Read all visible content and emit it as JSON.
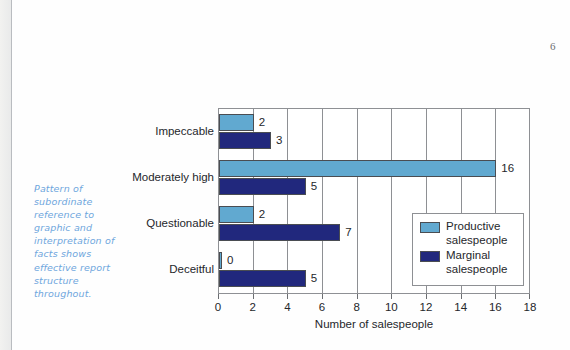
{
  "page": {
    "number": "6",
    "margin_note": "Pattern of subordinate reference to graphic and interpretation of facts shows effective report structure throughout."
  },
  "legend": {
    "items": [
      {
        "label": "Productive salespeople",
        "color": "#61a9d0",
        "key": "productive"
      },
      {
        "label": "Marginal salespeople",
        "color": "#21287d",
        "key": "marginal"
      }
    ]
  },
  "chart_data": {
    "type": "bar",
    "orientation": "horizontal",
    "title": "",
    "xlabel": "Number of salespeople",
    "ylabel": "",
    "xlim": [
      0,
      18
    ],
    "xticks": [
      "0",
      "2",
      "4",
      "6",
      "8",
      "10",
      "12",
      "14",
      "16",
      "18"
    ],
    "grid": true,
    "legend_position": "inside-right",
    "categories": [
      "Impeccable",
      "Moderately high",
      "Questionable",
      "Deceitful"
    ],
    "series": [
      {
        "name": "Productive salespeople",
        "color": "#61a9d0",
        "values": [
          2,
          16,
          2,
          0
        ]
      },
      {
        "name": "Marginal salespeople",
        "color": "#21287d",
        "values": [
          3,
          5,
          7,
          5
        ]
      }
    ],
    "data_labels": {
      "productive": [
        "2",
        "16",
        "2",
        "0"
      ],
      "marginal": [
        "3",
        "5",
        "7",
        "5"
      ]
    }
  }
}
